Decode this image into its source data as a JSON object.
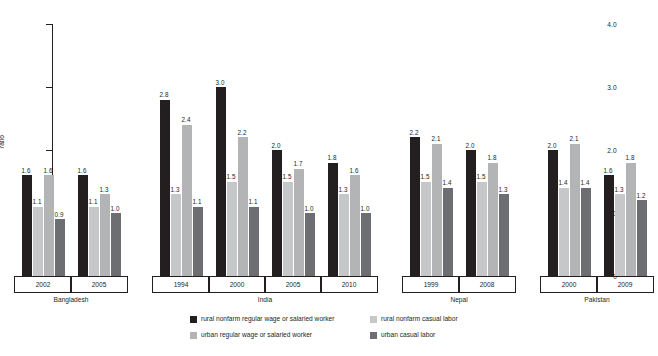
{
  "axis": {
    "y_label": "ratio",
    "y_ticks": [
      "0",
      "1.0",
      "2.0",
      "3.0",
      "4.0"
    ],
    "y_min": 0,
    "y_max": 4.0
  },
  "legend": {
    "items": [
      {
        "label": "rural nonfarm regular wage or salaried worker",
        "color": "#231f20"
      },
      {
        "label": "rural nonfarm casual labor",
        "color": "#c6c7c9"
      },
      {
        "label": "urban regular wage or salaried worker",
        "color": "#b2b4b6"
      },
      {
        "label": "urban casual labor",
        "color": "#6d6e71"
      }
    ]
  },
  "chart_data": {
    "type": "bar",
    "title": "",
    "xlabel": "",
    "ylabel": "ratio",
    "ylim": [
      0,
      4.0
    ],
    "yticks": [
      0,
      1.0,
      2.0,
      3.0,
      4.0
    ],
    "grid": false,
    "legend_position": "bottom",
    "series": [
      {
        "name": "rural nonfarm regular wage or salaried worker",
        "color": "#231f20",
        "values": [
          1.6,
          1.6,
          2.8,
          3.0,
          2.0,
          1.8,
          2.2,
          2.0,
          2.0,
          1.6
        ]
      },
      {
        "name": "rural nonfarm casual labor",
        "color": "#c6c7c9",
        "values": [
          1.1,
          1.1,
          1.3,
          1.5,
          1.5,
          1.3,
          1.5,
          1.5,
          1.4,
          1.3
        ]
      },
      {
        "name": "urban regular wage or salaried worker",
        "color": "#b2b4b6",
        "values": [
          1.6,
          1.3,
          2.4,
          2.2,
          1.7,
          1.6,
          2.1,
          1.8,
          2.1,
          1.8
        ]
      },
      {
        "name": "urban casual labor",
        "color": "#6d6e71",
        "values": [
          0.9,
          1.0,
          1.1,
          1.1,
          1.0,
          1.0,
          1.4,
          1.3,
          1.4,
          1.2
        ]
      }
    ],
    "categories": [
      "2002",
      "2005",
      "1994",
      "2000",
      "2005",
      "2010",
      "1999",
      "2008",
      "2000",
      "2009"
    ],
    "groups": [
      {
        "country": "Bangladesh",
        "years": [
          {
            "year": "2002",
            "bars": [
              {
                "series": "rural nonfarm regular wage or salaried worker",
                "value": 1.6,
                "label": "1.6",
                "color": "#231f20"
              },
              {
                "series": "rural nonfarm casual labor",
                "value": 1.1,
                "label": "1.1",
                "color": "#c6c7c9"
              },
              {
                "series": "urban regular wage or salaried worker",
                "value": 1.6,
                "label": "1.6",
                "color": "#b2b4b6"
              },
              {
                "series": "urban casual labor",
                "value": 0.9,
                "label": "0.9",
                "color": "#6d6e71"
              }
            ]
          },
          {
            "year": "2005",
            "bars": [
              {
                "series": "rural nonfarm regular wage or salaried worker",
                "value": 1.6,
                "label": "1.6",
                "color": "#231f20"
              },
              {
                "series": "rural nonfarm casual labor",
                "value": 1.1,
                "label": "1.1",
                "color": "#c6c7c9"
              },
              {
                "series": "urban regular wage or salaried worker",
                "value": 1.3,
                "label": "1.3",
                "color": "#b2b4b6"
              },
              {
                "series": "urban casual labor",
                "value": 1.0,
                "label": "1.0",
                "color": "#6d6e71"
              }
            ]
          }
        ]
      },
      {
        "country": "India",
        "years": [
          {
            "year": "1994",
            "bars": [
              {
                "series": "rural nonfarm regular wage or salaried worker",
                "value": 2.8,
                "label": "2.8",
                "color": "#231f20"
              },
              {
                "series": "rural nonfarm casual labor",
                "value": 1.3,
                "label": "1.3",
                "color": "#c6c7c9"
              },
              {
                "series": "urban regular wage or salaried worker",
                "value": 2.4,
                "label": "2.4",
                "color": "#b2b4b6"
              },
              {
                "series": "urban casual labor",
                "value": 1.1,
                "label": "1.1",
                "color": "#6d6e71"
              }
            ]
          },
          {
            "year": "2000",
            "bars": [
              {
                "series": "rural nonfarm regular wage or salaried worker",
                "value": 3.0,
                "label": "3.0",
                "color": "#231f20"
              },
              {
                "series": "rural nonfarm casual labor",
                "value": 1.5,
                "label": "1.5",
                "color": "#c6c7c9"
              },
              {
                "series": "urban regular wage or salaried worker",
                "value": 2.2,
                "label": "2.2",
                "color": "#b2b4b6"
              },
              {
                "series": "urban casual labor",
                "value": 1.1,
                "label": "1.1",
                "color": "#6d6e71"
              }
            ]
          },
          {
            "year": "2005",
            "bars": [
              {
                "series": "rural nonfarm regular wage or salaried worker",
                "value": 2.0,
                "label": "2.0",
                "color": "#231f20"
              },
              {
                "series": "rural nonfarm casual labor",
                "value": 1.5,
                "label": "1.5",
                "color": "#c6c7c9"
              },
              {
                "series": "urban regular wage or salaried worker",
                "value": 1.7,
                "label": "1.7",
                "color": "#b2b4b6"
              },
              {
                "series": "urban casual labor",
                "value": 1.0,
                "label": "1.0",
                "color": "#6d6e71"
              }
            ]
          },
          {
            "year": "2010",
            "bars": [
              {
                "series": "rural nonfarm regular wage or salaried worker",
                "value": 1.8,
                "label": "1.8",
                "color": "#231f20"
              },
              {
                "series": "rural nonfarm casual labor",
                "value": 1.3,
                "label": "1.3",
                "color": "#c6c7c9"
              },
              {
                "series": "urban regular wage or salaried worker",
                "value": 1.6,
                "label": "1.6",
                "color": "#b2b4b6"
              },
              {
                "series": "urban casual labor",
                "value": 1.0,
                "label": "1.0",
                "color": "#6d6e71"
              }
            ]
          }
        ]
      },
      {
        "country": "Nepal",
        "years": [
          {
            "year": "1999",
            "bars": [
              {
                "series": "rural nonfarm regular wage or salaried worker",
                "value": 2.2,
                "label": "2.2",
                "color": "#231f20"
              },
              {
                "series": "rural nonfarm casual labor",
                "value": 1.5,
                "label": "1.5",
                "color": "#c6c7c9"
              },
              {
                "series": "urban regular wage or salaried worker",
                "value": 2.1,
                "label": "2.1",
                "color": "#b2b4b6"
              },
              {
                "series": "urban casual labor",
                "value": 1.4,
                "label": "1.4",
                "color": "#6d6e71"
              }
            ]
          },
          {
            "year": "2008",
            "bars": [
              {
                "series": "rural nonfarm regular wage or salaried worker",
                "value": 2.0,
                "label": "2.0",
                "color": "#231f20"
              },
              {
                "series": "rural nonfarm casual labor",
                "value": 1.5,
                "label": "1.5",
                "color": "#c6c7c9"
              },
              {
                "series": "urban regular wage or salaried worker",
                "value": 1.8,
                "label": "1.8",
                "color": "#b2b4b6"
              },
              {
                "series": "urban casual labor",
                "value": 1.3,
                "label": "1.3",
                "color": "#6d6e71"
              }
            ]
          }
        ]
      },
      {
        "country": "Pakistan",
        "years": [
          {
            "year": "2000",
            "bars": [
              {
                "series": "rural nonfarm regular wage or salaried worker",
                "value": 2.0,
                "label": "2.0",
                "color": "#231f20"
              },
              {
                "series": "rural nonfarm casual labor",
                "value": 1.4,
                "label": "1.4",
                "color": "#c6c7c9"
              },
              {
                "series": "urban regular wage or salaried worker",
                "value": 2.1,
                "label": "2.1",
                "color": "#b2b4b6"
              },
              {
                "series": "urban casual labor",
                "value": 1.4,
                "label": "1.4",
                "color": "#6d6e71"
              }
            ]
          },
          {
            "year": "2009",
            "bars": [
              {
                "series": "rural nonfarm regular wage or salaried worker",
                "value": 1.6,
                "label": "1.6",
                "color": "#231f20"
              },
              {
                "series": "rural nonfarm casual labor",
                "value": 1.3,
                "label": "1.3",
                "color": "#c6c7c9"
              },
              {
                "series": "urban regular wage or salaried worker",
                "value": 1.8,
                "label": "1.8",
                "color": "#b2b4b6"
              },
              {
                "series": "urban casual labor",
                "value": 1.2,
                "label": "1.2",
                "color": "#6d6e71"
              }
            ]
          }
        ]
      }
    ]
  }
}
